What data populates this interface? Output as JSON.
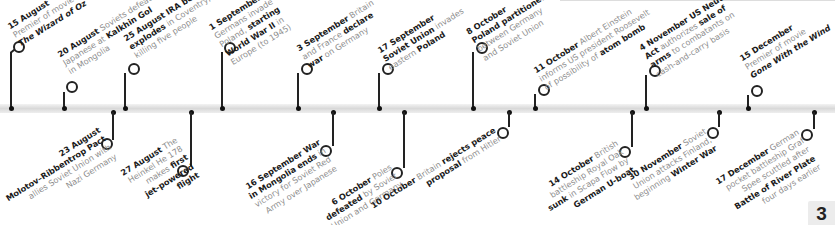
{
  "timeline": {
    "bar_color": "#dcdcdc",
    "top_events": [
      {
        "date": "15 August",
        "lines": [
          [
            "",
            "Premier of movie"
          ],
          [
            "i",
            "The Wizard of Oz"
          ]
        ]
      },
      {
        "date": "20 August",
        "lines": [
          [
            "",
            "Soviets defeat"
          ],
          [
            "",
            "Japanese at "
          ],
          [
            "b",
            "Kalkhin Gol"
          ],
          [
            "",
            "in Mongolia"
          ]
        ]
      },
      {
        "date": "25 August",
        "lines": [
          [
            "b",
            "IRA bomb"
          ],
          [
            "b",
            "explodes"
          ],
          [
            "",
            "in Coventry,"
          ],
          [
            "",
            "killing five people"
          ]
        ]
      },
      {
        "date": "1 September",
        "lines": [
          [
            "",
            "Germans invade"
          ],
          [
            "",
            "Poland, "
          ],
          [
            "b",
            "starting"
          ],
          [
            "b",
            "World War II"
          ],
          [
            "",
            "in"
          ],
          [
            "",
            "Europe (to 1945)"
          ]
        ]
      },
      {
        "date": "3 September",
        "lines": [
          [
            "",
            "Britain"
          ],
          [
            "",
            "and France "
          ],
          [
            "b",
            "declare"
          ],
          [
            "b",
            "war"
          ],
          [
            "",
            "on Germany"
          ]
        ]
      },
      {
        "date": "17 September",
        "lines": [
          [
            "b",
            "Soviet Union"
          ],
          [
            "",
            "invades"
          ],
          [
            "",
            "eastern "
          ],
          [
            "b",
            "Poland"
          ]
        ]
      },
      {
        "date": "8 October",
        "lines": [
          [
            "b",
            "Poland partitioned"
          ],
          [
            "",
            "between Germany"
          ],
          [
            "",
            "and Soviet Union"
          ]
        ]
      },
      {
        "date": "11 October",
        "lines": [
          [
            "",
            "Albert Einstein"
          ],
          [
            "",
            "informs US president Roosevelt"
          ],
          [
            "",
            "of possibility of "
          ],
          [
            "b",
            "atom bomb"
          ]
        ]
      },
      {
        "date": "4 November",
        "lines": [
          [
            "b",
            "US Neutrality"
          ],
          [
            "b",
            "Act"
          ],
          [
            "",
            "authorizes "
          ],
          [
            "b",
            "sale of"
          ],
          [
            "b",
            "arms"
          ],
          [
            "",
            "to combatants on"
          ],
          [
            "",
            "cash-and-carry basis"
          ]
        ]
      },
      {
        "date": "15 December",
        "lines": [
          [
            "",
            "Premier of movie"
          ],
          [
            "i",
            "Gone With the Wind"
          ]
        ]
      }
    ],
    "bottom_events": [
      {
        "date": "23 August",
        "lines": [
          [
            "b",
            "Molotov–Ribbentrop Pact"
          ],
          [
            "",
            "allies Soviet Union with"
          ],
          [
            "",
            "Nazi Germany"
          ]
        ]
      },
      {
        "date": "27 August",
        "lines": [
          [
            "",
            "The"
          ],
          [
            "",
            "Heinkel He 178"
          ],
          [
            "",
            "makes "
          ],
          [
            "b",
            "first"
          ],
          [
            "b",
            "jet-powered"
          ],
          [
            "b",
            "flight"
          ]
        ]
      },
      {
        "date": "16 September",
        "lines": [
          [
            "b",
            "War"
          ],
          [
            "b",
            "in Mongolia ends"
          ],
          [
            "",
            "in"
          ],
          [
            "",
            "victory for Soviet Red"
          ],
          [
            "",
            "Army over Japanese"
          ]
        ]
      },
      {
        "date": "6 October",
        "lines": [
          [
            "",
            "Poles"
          ],
          [
            "b",
            "defeated"
          ],
          [
            "",
            "by Soviet"
          ],
          [
            "",
            "Union and Germany"
          ]
        ]
      },
      {
        "date": "10 October",
        "lines": [
          [
            "",
            "Britain "
          ],
          [
            "b",
            "rejects peace"
          ],
          [
            "b",
            "proposal"
          ],
          [
            "",
            "from Hitler"
          ]
        ]
      },
      {
        "date": "14 October",
        "lines": [
          [
            "",
            "British"
          ],
          [
            "",
            "battleship Royal Oak"
          ],
          [
            "b",
            "sunk"
          ],
          [
            "",
            "in Scapa Flow by"
          ],
          [
            "b",
            "German U-boat"
          ]
        ]
      },
      {
        "date": "30 November",
        "lines": [
          [
            "",
            "Soviet"
          ],
          [
            "",
            "Union attacks Finland,"
          ],
          [
            "",
            "beginning "
          ],
          [
            "b",
            "Winter War"
          ]
        ]
      },
      {
        "date": "17 December",
        "lines": [
          [
            "",
            "German"
          ],
          [
            "",
            "pocket battleship Graf"
          ],
          [
            "",
            "Spee scuttled after"
          ],
          [
            "b",
            "Battle of River Plate"
          ],
          [
            "",
            "four days earlier"
          ]
        ]
      }
    ]
  },
  "labels": {
    "t0": {
      "date": "15 August",
      "l1": "Premier of movie",
      "l2": "The Wizard of Oz"
    },
    "t1": {
      "date": "20 August",
      "l1a": "Soviets defeat",
      "l2a": "Japanese at ",
      "l2b": "Kalkhin Gol",
      "l3": "in Mongolia"
    },
    "t2": {
      "date": "25 August",
      "l1a": "IRA bomb",
      "l2a": "explodes",
      "l2b": " in Coventry,",
      "l3": "killing five people"
    },
    "t3": {
      "date": "1 September",
      "l1": "Germans invade",
      "l2a": "Poland, ",
      "l2b": "starting",
      "l3a": "World War II",
      "l3b": " in",
      "l4": "Europe (to 1945)"
    },
    "t4": {
      "date": "3 September",
      "l1": " Britain",
      "l2a": "and France ",
      "l2b": "declare",
      "l3a": "war",
      "l3b": " on Germany"
    },
    "t5": {
      "date": "17 September",
      "l2a": "Soviet Union",
      "l2b": " invades",
      "l3a": "eastern ",
      "l3b": "Poland"
    },
    "t6": {
      "date": "8 October",
      "l2": "Poland partitioned",
      "l3": "between Germany",
      "l4": "and Soviet Union"
    },
    "t7": {
      "date": "11 October",
      "l1": " Albert Einstein",
      "l2": "informs US president Roosevelt",
      "l3a": "of possibility of ",
      "l3b": "atom bomb"
    },
    "t8": {
      "date": "4 November",
      "l1b": " US Neutrality",
      "l2a": "Act",
      "l2b": " authorizes ",
      "l2c": "sale of",
      "l3a": "arms",
      "l3b": " to combatants on",
      "l4": "cash-and-carry basis"
    },
    "t9": {
      "date": "15 December",
      "l2": "Premier of movie",
      "l3": "Gone With the Wind"
    },
    "b0": {
      "date": "23 August",
      "l2": "Molotov–Ribbentrop Pact",
      "l3": "allies Soviet Union with",
      "l4": "Nazi Germany"
    },
    "b1": {
      "date": "27 August",
      "l1b": " The",
      "l2": "Heinkel He 178",
      "l3a": "makes ",
      "l3b": "first",
      "l4": "jet-powered",
      "l5": "flight"
    },
    "b2": {
      "date": "16 September",
      "l1b": " War",
      "l2a": "in Mongolia ends",
      "l2b": " in",
      "l3": "victory for Soviet Red",
      "l4": "Army over Japanese"
    },
    "b3": {
      "date": "6 October",
      "l1b": " Poles",
      "l2a": "defeated",
      "l2b": " by Soviet",
      "l3": "Union and Germany"
    },
    "b4": {
      "date": "10 October",
      "l1b": " Britain ",
      "l1c": "rejects peace",
      "l2a": "proposal",
      "l2b": " from Hitler"
    },
    "b5": {
      "date": "14 October",
      "l1b": " British",
      "l2": "battleship Royal Oak",
      "l3a": "sunk",
      "l3b": " in Scapa Flow by",
      "l4": "German U-boat"
    },
    "b6": {
      "date": "30 November",
      "l1b": " Soviet",
      "l2": "Union attacks Finland,",
      "l3a": "beginning ",
      "l3b": "Winter War"
    },
    "b7": {
      "date": "17 December",
      "l1b": " German",
      "l2": "pocket battleship Graf",
      "l3": "Spee scuttled after",
      "l4": "Battle of River Plate",
      "l5": "four days earlier"
    }
  },
  "page_number": "3"
}
